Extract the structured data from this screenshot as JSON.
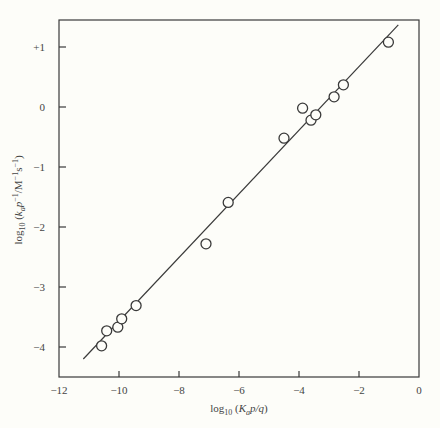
{
  "chart_data": {
    "type": "scatter",
    "title": "",
    "xlabel": "log10 (K_a p/q)",
    "ylabel": "log10 (k_a p^-1/M^-1 s^-1)",
    "xlim": [
      -12,
      0
    ],
    "ylim": [
      -4.5,
      1.45
    ],
    "x_ticks": [
      -12,
      -10,
      -8,
      -6,
      -4,
      -2,
      0
    ],
    "x_tick_labels": [
      "-12",
      "-10",
      "-8",
      "-6",
      "-4",
      "-2",
      "0"
    ],
    "y_ticks": [
      1,
      0,
      -1,
      -2,
      -3,
      -4
    ],
    "y_tick_labels": [
      "+1",
      "0",
      "-1",
      "-2",
      "-3",
      "-4"
    ],
    "grid": false,
    "legend": null,
    "series": [
      {
        "name": "observed",
        "marker": "open-circle",
        "points": [
          {
            "x": -10.58,
            "y": -3.98
          },
          {
            "x": -10.41,
            "y": -3.73
          },
          {
            "x": -10.04,
            "y": -3.67
          },
          {
            "x": -9.91,
            "y": -3.53
          },
          {
            "x": -9.43,
            "y": -3.31
          },
          {
            "x": -7.1,
            "y": -2.28
          },
          {
            "x": -6.36,
            "y": -1.59
          },
          {
            "x": -4.5,
            "y": -0.52
          },
          {
            "x": -3.88,
            "y": -0.02
          },
          {
            "x": -3.6,
            "y": -0.22
          },
          {
            "x": -3.44,
            "y": -0.13
          },
          {
            "x": -2.83,
            "y": 0.17
          },
          {
            "x": -2.52,
            "y": 0.37
          },
          {
            "x": -1.02,
            "y": 1.08
          }
        ]
      },
      {
        "name": "fit line",
        "type": "line",
        "points": [
          {
            "x": -11.19,
            "y": -4.2
          },
          {
            "x": -0.69,
            "y": 1.37
          }
        ]
      }
    ]
  },
  "labels": {
    "xlabel_main": "log",
    "xlabel_sub": "10",
    "xlabel_rest_open": " (",
    "xlabel_K": "K",
    "xlabel_a": "a",
    "xlabel_pq": "p/q",
    "xlabel_close": ")",
    "ylabel_main": "log",
    "ylabel_sub": "10",
    "ylabel_open": " (",
    "ylabel_k": "k",
    "ylabel_a": "a",
    "ylabel_p": "p",
    "ylabel_pexp": "−1",
    "ylabel_unit": "/M",
    "ylabel_uexp": "−1",
    "ylabel_s": "s",
    "ylabel_sexp": "−1",
    "ylabel_close": ")"
  },
  "colors": {
    "ink": "#3a3a3a",
    "background": "#fdfdf9"
  }
}
